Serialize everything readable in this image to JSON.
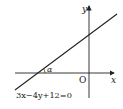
{
  "diagram": {
    "axes": {
      "x_label": "x",
      "y_label": "y",
      "origin_label": "O"
    },
    "line": {
      "equation": "3x−4y+12=0",
      "slope": 0.75,
      "x_intercept": -4,
      "y_intercept": 3
    },
    "angle_label": "α",
    "colors": {
      "stroke": "#222222",
      "background": "#ffffff"
    }
  }
}
